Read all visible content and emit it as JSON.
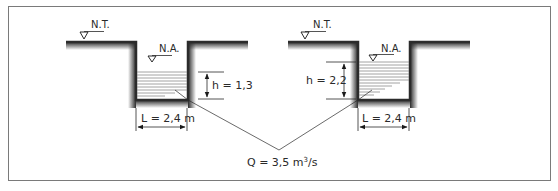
{
  "diagram": {
    "type": "two-channel rectangular section comparison",
    "colors": {
      "border": "#7a7a7a",
      "wall": "#2b2b2b",
      "water_lines": "#8a8a8a",
      "text": "#2a2a2a"
    },
    "left_channel": {
      "ground_label": "N.T.",
      "water_label": "N.A.",
      "depth_label": "h = 1,3",
      "width_label": "L = 2,4 m"
    },
    "right_channel": {
      "ground_label": "N.T.",
      "water_label": "N.A.",
      "depth_label": "h = 2,2",
      "width_label": "L = 2,4 m"
    },
    "discharge": {
      "prefix": "Q = 3,5 m",
      "exponent": "3",
      "suffix": "/s"
    }
  }
}
